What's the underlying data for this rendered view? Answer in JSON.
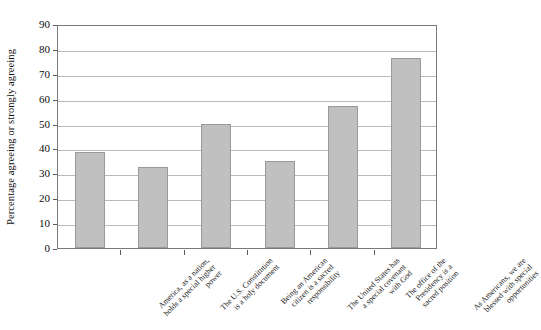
{
  "chart_data": {
    "type": "bar",
    "title": "",
    "xlabel": "",
    "ylabel": "Percentage agreeing or strongly agreeing",
    "ylim": [
      0,
      90
    ],
    "ytick_step": 10,
    "yticks": [
      "0",
      "10",
      "20",
      "30",
      "40",
      "50",
      "60",
      "70",
      "80",
      "90"
    ],
    "grid": true,
    "legend": false,
    "bar_color": "#c0c0c0",
    "bar_border_color": "#9a9a9a",
    "categories": [
      "America, as a nation, holds a special higher power",
      "The U.S. Constitution is a holy document",
      "Being an American citizen is a sacred responsibility",
      "The United States has a special covenant with God",
      "The office of the Presidency is a sacred position",
      "As Americans, we are blessed with special opportunities"
    ],
    "category_lines": [
      [
        "America, as a nation,",
        "holds a special higher",
        "power"
      ],
      [
        "The U.S. Constitution",
        "is a holy document"
      ],
      [
        "Being an American",
        "citizen is a sacred",
        "responsibility"
      ],
      [
        "The United States has",
        "a special covenant",
        "with God"
      ],
      [
        "The office of the",
        "Presidency is a",
        "sacred position"
      ],
      [
        "As Americans, we are",
        "blessed with special",
        "opportunities"
      ]
    ],
    "values": [
      38.5,
      32.5,
      50,
      35,
      57,
      76.5
    ]
  }
}
